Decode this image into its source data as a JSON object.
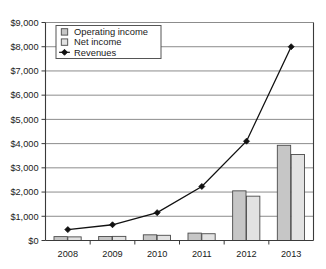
{
  "chart_data": {
    "type": "bar",
    "title": "",
    "subtitle": "",
    "xlabel": "",
    "ylabel": "",
    "categories": [
      "2008",
      "2009",
      "2010",
      "2011",
      "2012",
      "2013"
    ],
    "ylim": [
      0,
      9000
    ],
    "ytick_step": 1000,
    "ytick_labels": [
      "$0",
      "$1,000",
      "$2,000",
      "$3,000",
      "$4,000",
      "$5,000",
      "$6,000",
      "$7,000",
      "$8,000",
      "$9,000"
    ],
    "ytick_values": [
      0,
      1000,
      2000,
      3000,
      4000,
      5000,
      6000,
      7000,
      8000,
      9000
    ],
    "grid": true,
    "legend_position": "top-left",
    "series": [
      {
        "name": "Operating income",
        "type": "bar",
        "marker": "square",
        "color": "#c6c6c6",
        "border_color": "#4a4a4a",
        "values": [
          160,
          165,
          235,
          305,
          2050,
          3930
        ]
      },
      {
        "name": "Net income",
        "type": "bar",
        "marker": "square",
        "color": "#e2e2e2",
        "border_color": "#4a4a4a",
        "values": [
          150,
          170,
          215,
          280,
          1830,
          3550
        ]
      },
      {
        "name": "Revenues",
        "type": "line",
        "marker": "diamond",
        "color": "#111111",
        "values": [
          450,
          650,
          1150,
          2230,
          4100,
          8000
        ]
      }
    ]
  },
  "legend": {
    "entries": [
      {
        "label": "Operating income",
        "marker": "square"
      },
      {
        "label": "Net income",
        "marker": "square"
      },
      {
        "label": "Revenues",
        "marker": "diamond"
      }
    ]
  },
  "colors": {
    "operating_income": "#c6c6c6",
    "net_income": "#e2e2e2",
    "revenues": "#111111",
    "gridline": "#6e6e6e",
    "axis": "#3a3a3a",
    "background": "#ffffff"
  }
}
